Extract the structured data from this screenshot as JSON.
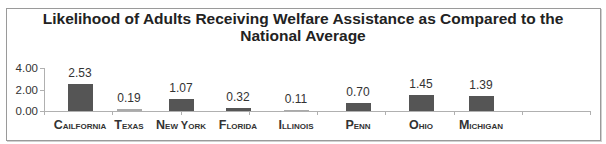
{
  "chart_data": {
    "type": "bar",
    "title": "Likelihood of Adults Receiving Welfare Assistance as Compared to the National Average",
    "title_lines": [
      "Likelihood of Adults Receiving Welfare Assistance as Compared to the",
      "National Average"
    ],
    "xlabel": "",
    "ylabel": "",
    "ylim": [
      0,
      4
    ],
    "yticks": [
      "4.00",
      "2.00",
      "0.00"
    ],
    "categories": [
      "Cailfornia",
      "Texas",
      "New York",
      "Florida",
      "Illinois",
      "Penn",
      "Ohio",
      "Michigan"
    ],
    "values": [
      2.53,
      0.19,
      1.07,
      0.32,
      0.11,
      0.7,
      1.45,
      1.39
    ],
    "value_labels": [
      "2.53",
      "0.19",
      "1.07",
      "0.32",
      "0.11",
      "0.70",
      "1.45",
      "1.39"
    ],
    "grid": false,
    "legend": null,
    "colors": {
      "bar": "#555555",
      "bar_light": "#aaaaaa",
      "axis": "#b0b0b0",
      "frame": "#9a9a9a"
    }
  }
}
